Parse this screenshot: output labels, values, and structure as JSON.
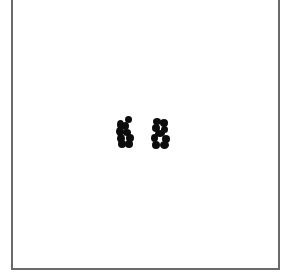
{
  "canvas": {
    "background": "#ffffff",
    "frame_color": "#6a6a6a"
  },
  "marks": [
    {
      "id": "mark-1",
      "shape": "distorted-glyph",
      "approx_char": "K",
      "color": "#0c0c0c"
    },
    {
      "id": "mark-2",
      "shape": "distorted-glyph",
      "approx_char": "S",
      "color": "#0c0c0c"
    }
  ]
}
